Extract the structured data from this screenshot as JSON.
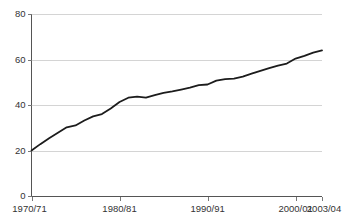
{
  "chart_data": {
    "type": "line",
    "title": "",
    "subtitle": "",
    "xlabel": "",
    "ylabel": "",
    "grid": "horizontal",
    "legend": "none",
    "ylim": [
      0,
      80
    ],
    "yticks": [
      0,
      20,
      40,
      60,
      80
    ],
    "ytick_labels": [
      "0",
      "20",
      "40",
      "60",
      "80"
    ],
    "xtick_labels": [
      "1970/71",
      "1980/81",
      "1990/91",
      "2000/01",
      "2003/04"
    ],
    "xtick_index": [
      0,
      10,
      20,
      30,
      33
    ],
    "categories": [
      "1970/71",
      "1971/72",
      "1972/73",
      "1973/74",
      "1974/75",
      "1975/76",
      "1976/77",
      "1977/78",
      "1978/79",
      "1979/80",
      "1980/81",
      "1981/82",
      "1982/83",
      "1983/84",
      "1984/85",
      "1985/86",
      "1986/87",
      "1987/88",
      "1988/89",
      "1989/90",
      "1990/91",
      "1991/92",
      "1992/93",
      "1993/94",
      "1994/95",
      "1995/96",
      "1996/97",
      "1997/98",
      "1998/99",
      "1999/00",
      "2000/01",
      "2001/02",
      "2002/03",
      "2003/04"
    ],
    "series": [
      {
        "name": "value",
        "values": [
          20.0,
          22.8,
          25.4,
          27.8,
          30.2,
          31.0,
          33.2,
          35.0,
          36.0,
          38.5,
          41.3,
          43.2,
          43.7,
          43.2,
          44.3,
          45.3,
          46.0,
          46.8,
          47.6,
          48.7,
          49.0,
          50.7,
          51.4,
          51.6,
          52.5,
          53.8,
          55.0,
          56.2,
          57.3,
          58.2,
          60.4,
          61.6,
          63.0,
          64.0
        ]
      }
    ]
  },
  "accessibility": {
    "chart_description": "Line chart rising from 20 in 1970/71 to about 64 in 2003/04"
  },
  "colors": {
    "line": "#1c1c1c",
    "grid": "#d4d4d4",
    "axis": "#555555",
    "text": "#333333",
    "background": "#ffffff"
  }
}
